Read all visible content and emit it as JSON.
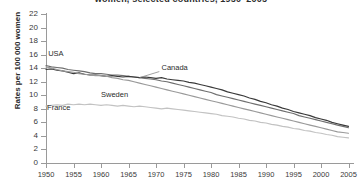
{
  "chart_data": {
    "type": "line",
    "title": "women, selected countries, 1950–2005",
    "xlabel": "",
    "ylabel": "Rates per 100 000 women",
    "xlim": [
      1950,
      2006
    ],
    "ylim": [
      0,
      22
    ],
    "xticks": [
      1950,
      1955,
      1960,
      1965,
      1970,
      1975,
      1980,
      1985,
      1990,
      1995,
      2000,
      2005
    ],
    "yticks": [
      0,
      2,
      4,
      6,
      8,
      10,
      12,
      14,
      16,
      18,
      20,
      22
    ],
    "grid": false,
    "legend_position": "inline-annotations",
    "series": [
      {
        "name": "USA",
        "color": "#6f6f6f",
        "x": [
          1950,
          1951,
          1952,
          1953,
          1954,
          1955,
          1956,
          1957,
          1958,
          1959,
          1960,
          1961,
          1962,
          1963,
          1964,
          1965,
          1966,
          1967,
          1968,
          1969,
          1970,
          1971,
          1972,
          1973,
          1974,
          1975,
          1976,
          1977,
          1978,
          1979,
          1980,
          1981,
          1982,
          1983,
          1984,
          1985,
          1986,
          1987,
          1988,
          1989,
          1990,
          1991,
          1992,
          1993,
          1994,
          1995,
          1996,
          1997,
          1998,
          1999,
          2000,
          2001,
          2002,
          2003,
          2004,
          2005
        ],
        "values": [
          14.4,
          14.2,
          14.1,
          14.0,
          13.8,
          13.7,
          13.6,
          13.5,
          13.3,
          13.2,
          13.2,
          13.1,
          13.0,
          13.0,
          12.9,
          12.8,
          12.7,
          12.6,
          12.5,
          12.4,
          12.3,
          12.1,
          12.0,
          11.8,
          11.6,
          11.4,
          11.2,
          11.0,
          10.8,
          10.6,
          10.4,
          10.1,
          9.9,
          9.7,
          9.5,
          9.3,
          9.1,
          8.9,
          8.7,
          8.5,
          8.3,
          8.1,
          7.9,
          7.7,
          7.5,
          7.3,
          7.0,
          6.8,
          6.6,
          6.4,
          6.2,
          6.0,
          5.8,
          5.6,
          5.4,
          5.2
        ]
      },
      {
        "name": "Canada",
        "color": "#3a3a3a",
        "x": [
          1950,
          1951,
          1952,
          1953,
          1954,
          1955,
          1956,
          1957,
          1958,
          1959,
          1960,
          1961,
          1962,
          1963,
          1964,
          1965,
          1966,
          1967,
          1968,
          1969,
          1970,
          1971,
          1972,
          1973,
          1974,
          1975,
          1976,
          1977,
          1978,
          1979,
          1980,
          1981,
          1982,
          1983,
          1984,
          1985,
          1986,
          1987,
          1988,
          1989,
          1990,
          1991,
          1992,
          1993,
          1994,
          1995,
          1996,
          1997,
          1998,
          1999,
          2000,
          2001,
          2002,
          2003,
          2004,
          2005
        ],
        "values": [
          13.8,
          13.9,
          13.7,
          13.6,
          13.4,
          13.2,
          13.3,
          13.1,
          13.0,
          13.0,
          12.9,
          12.8,
          12.9,
          12.8,
          12.7,
          12.8,
          12.7,
          12.6,
          12.7,
          12.6,
          12.5,
          12.6,
          12.4,
          12.3,
          12.2,
          12.1,
          11.9,
          11.8,
          11.6,
          11.4,
          11.2,
          11.0,
          10.8,
          10.5,
          10.3,
          10.1,
          9.9,
          9.6,
          9.4,
          9.1,
          8.9,
          8.6,
          8.4,
          8.1,
          7.9,
          7.6,
          7.4,
          7.2,
          7.0,
          6.7,
          6.5,
          6.3,
          6.0,
          5.8,
          5.6,
          5.4
        ]
      },
      {
        "name": "Sweden",
        "color": "#9a9a9a",
        "x": [
          1950,
          1951,
          1952,
          1953,
          1954,
          1955,
          1956,
          1957,
          1958,
          1959,
          1960,
          1961,
          1962,
          1963,
          1964,
          1965,
          1966,
          1967,
          1968,
          1969,
          1970,
          1971,
          1972,
          1973,
          1974,
          1975,
          1976,
          1977,
          1978,
          1979,
          1980,
          1981,
          1982,
          1983,
          1984,
          1985,
          1986,
          1987,
          1988,
          1989,
          1990,
          1991,
          1992,
          1993,
          1994,
          1995,
          1996,
          1997,
          1998,
          1999,
          2000,
          2001,
          2002,
          2003,
          2004,
          2005
        ],
        "values": [
          14.2,
          14.0,
          13.8,
          13.6,
          13.5,
          13.4,
          13.2,
          13.1,
          13.0,
          12.9,
          12.9,
          12.8,
          12.6,
          12.5,
          12.3,
          12.2,
          12.0,
          11.8,
          11.6,
          11.4,
          11.2,
          11.0,
          10.8,
          10.6,
          10.4,
          10.2,
          10.0,
          9.8,
          9.6,
          9.4,
          9.2,
          9.0,
          8.8,
          8.6,
          8.4,
          8.2,
          8.0,
          7.8,
          7.6,
          7.4,
          7.2,
          7.0,
          6.8,
          6.6,
          6.4,
          6.2,
          6.0,
          5.8,
          5.6,
          5.4,
          5.2,
          5.0,
          4.8,
          4.6,
          4.5,
          4.4
        ]
      },
      {
        "name": "France",
        "color": "#c2c2c2",
        "x": [
          1950,
          1951,
          1952,
          1953,
          1954,
          1955,
          1956,
          1957,
          1958,
          1959,
          1960,
          1961,
          1962,
          1963,
          1964,
          1965,
          1966,
          1967,
          1968,
          1969,
          1970,
          1971,
          1972,
          1973,
          1974,
          1975,
          1976,
          1977,
          1978,
          1979,
          1980,
          1981,
          1982,
          1983,
          1984,
          1985,
          1986,
          1987,
          1988,
          1989,
          1990,
          1991,
          1992,
          1993,
          1994,
          1995,
          1996,
          1997,
          1998,
          1999,
          2000,
          2001,
          2002,
          2003,
          2004,
          2005
        ],
        "values": [
          8.4,
          8.5,
          8.6,
          8.5,
          8.7,
          8.6,
          8.7,
          8.6,
          8.7,
          8.6,
          8.5,
          8.6,
          8.5,
          8.4,
          8.5,
          8.4,
          8.3,
          8.4,
          8.3,
          8.2,
          8.1,
          8.0,
          8.1,
          8.0,
          7.9,
          7.8,
          7.7,
          7.6,
          7.5,
          7.4,
          7.3,
          7.2,
          7.0,
          6.9,
          6.8,
          6.6,
          6.5,
          6.3,
          6.2,
          6.0,
          5.9,
          5.7,
          5.6,
          5.4,
          5.3,
          5.1,
          5.0,
          4.8,
          4.7,
          4.5,
          4.4,
          4.2,
          4.1,
          3.9,
          3.8,
          3.7
        ]
      }
    ],
    "annotations": [
      {
        "text": "USA",
        "x": 1950.4,
        "y": 16.1
      },
      {
        "text": "Canada",
        "x": 1971.0,
        "y": 14.0
      },
      {
        "text": "Sweden",
        "x": 1960.0,
        "y": 10.1
      },
      {
        "text": "France",
        "x": 1950.2,
        "y": 8.1
      }
    ]
  }
}
